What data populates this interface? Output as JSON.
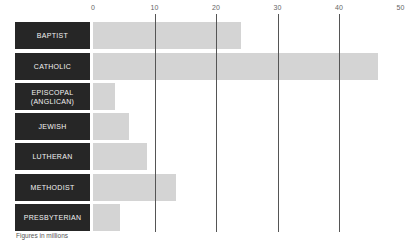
{
  "chart_data": {
    "type": "bar",
    "orientation": "horizontal",
    "title": "",
    "xlabel": "",
    "ylabel": "",
    "categories": [
      "BAPTIST",
      "CATHOLIC",
      "EPISCOPAL\n(ANGLICAN)",
      "JEWISH",
      "LUTHERAN",
      "METHODIST",
      "PRESBYTERIAN"
    ],
    "values": [
      24,
      46.3,
      3.6,
      5.9,
      8.8,
      13.5,
      4.4
    ],
    "xlim": [
      0,
      50
    ],
    "x_ticks": [
      0,
      10,
      20,
      30,
      40,
      50
    ],
    "grid": true,
    "legend": null,
    "annotations": [
      "Figures in millions"
    ]
  },
  "footnote": "Figures in millions",
  "colors": {
    "label_bg": "#262626",
    "label_text": "#f2f2f2",
    "bar": "#d4d4d4",
    "gridline": "#555555"
  }
}
